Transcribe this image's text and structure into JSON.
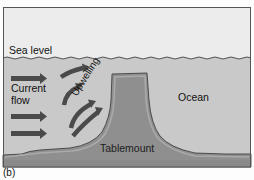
{
  "figure": {
    "caption": "(b)",
    "labels": {
      "sea_level": "Sea level",
      "current_flow_line1": "Current",
      "current_flow_line2": "flow",
      "upwelling": "Upwelling",
      "ocean": "Ocean",
      "tablemount": "Tablemount"
    },
    "colors": {
      "sky": "#ececec",
      "water": "#c6c6c6",
      "tablemount": "#8f8f8f",
      "tablemount_top": "#a3a3a3",
      "seafloor": "#909090",
      "arrow": "#4a4a4a",
      "frame": "#555555"
    }
  }
}
